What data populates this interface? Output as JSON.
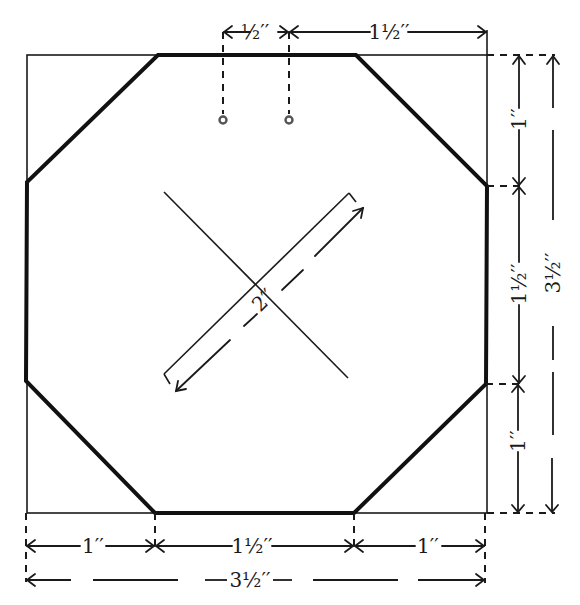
{
  "diagram": {
    "shapes": {
      "outer_square": {
        "x": 27,
        "y": 55,
        "size_px": 460,
        "size_in": "3½\""
      },
      "octagon": {
        "corner_cut_in": "1\"",
        "side_in": "1½\""
      },
      "holes": [
        {
          "x": 223,
          "y": 120
        },
        {
          "x": 289,
          "y": 120
        }
      ],
      "diagonal_lines": 2
    },
    "labels": {
      "top_hole_spacing": "½′′",
      "top_hole_to_edge": "1½′′",
      "right_top": "1′′",
      "right_middle": "1½′′",
      "right_bottom": "1′′",
      "right_total": "3½′′",
      "bottom_left": "1′′",
      "bottom_middle": "1½′′",
      "bottom_right": "1′′",
      "bottom_total": "3½′′",
      "diagonal": "2′′"
    },
    "colors": {
      "stroke": "#1a1a1a",
      "hole": "#555555",
      "background": "#ffffff"
    }
  }
}
